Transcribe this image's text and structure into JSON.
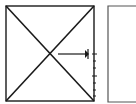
{
  "diagram": {
    "stroke_color": "#1a1a1a",
    "secondary_stroke_color": "#555555",
    "main_box": {
      "x": 6,
      "y": 6,
      "w": 88,
      "h": 95
    },
    "diagonals": true,
    "center": {
      "x": 50,
      "y": 54
    },
    "arrow": {
      "x1": 57,
      "y1": 54,
      "x2": 88,
      "y2": 54,
      "direction": "right"
    },
    "tick_ruler": {
      "x": 94,
      "y_start": 54,
      "y_end": 98,
      "tick_count": 7
    },
    "partial_box": {
      "x": 108,
      "y": 6,
      "w": 40,
      "h": 97
    }
  }
}
